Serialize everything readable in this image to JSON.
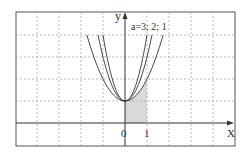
{
  "figure": {
    "type": "function-graph",
    "axes": {
      "x_label": "X",
      "y_label": "y",
      "origin_label": "0",
      "tick_labels": [
        {
          "x": 1,
          "label": "1"
        }
      ],
      "x_range": [
        -5,
        5
      ],
      "y_range": [
        -1,
        4
      ],
      "grid": true,
      "grid_style": "dashed"
    },
    "curve_label": "a=3; 2; 1",
    "curves": [
      {
        "name": "a=3",
        "formula": "y = 3x^2 + 1",
        "a": 3
      },
      {
        "name": "a=2",
        "formula": "y = 2x^2 + 1",
        "a": 2
      },
      {
        "name": "a=1",
        "formula": "y = x^2 + 1",
        "a": 1
      }
    ],
    "shaded_region": {
      "under_curve": "y = x^2 + 1",
      "x_from": 0,
      "x_to": 1,
      "color": "#d9d9d9"
    },
    "colors": {
      "frame": "#555555",
      "grid": "#aaaaaa",
      "axis": "#333333",
      "curve": "#333333",
      "shade": "#d9d9d9"
    }
  }
}
